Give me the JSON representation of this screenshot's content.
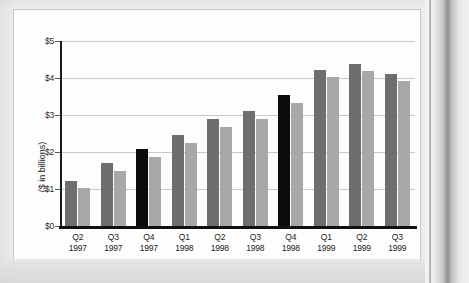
{
  "chart_data": {
    "type": "bar",
    "title": "",
    "subtitle": "",
    "xlabel": "",
    "ylabel": "($ in billions)",
    "ylim": [
      0,
      5
    ],
    "ytick_labels": [
      "$5",
      "$4",
      "$3",
      "$2",
      "$1",
      "$0"
    ],
    "ytick_values": [
      5,
      4,
      3,
      2,
      1,
      0
    ],
    "grid": true,
    "legend_position": "none",
    "categories": [
      "Q2\n1997",
      "Q3\n1997",
      "Q4\n1997",
      "Q1\n1998",
      "Q2\n1998",
      "Q3\n1998",
      "Q4\n1998",
      "Q1\n1999",
      "Q2\n1999",
      "Q3\n1999"
    ],
    "category_quarters": [
      "Q2",
      "Q3",
      "Q4",
      "Q1",
      "Q2",
      "Q3",
      "Q4",
      "Q1",
      "Q2",
      "Q3"
    ],
    "category_years": [
      "1997",
      "1997",
      "1997",
      "1998",
      "1998",
      "1998",
      "1998",
      "1999",
      "1999",
      "1999"
    ],
    "series": [
      {
        "name": "primary",
        "values": [
          1.22,
          1.7,
          2.07,
          2.45,
          2.89,
          3.1,
          3.53,
          4.22,
          4.38,
          4.11
        ],
        "color": "#6e6e6e",
        "highlight_color": "#0c0c0c",
        "highlighted_indices": [
          2,
          6
        ]
      },
      {
        "name": "secondary",
        "values": [
          1.04,
          1.49,
          1.86,
          2.25,
          2.68,
          2.9,
          3.33,
          4.02,
          4.18,
          3.91
        ],
        "color": "#a8a8a8"
      }
    ]
  },
  "colors": {
    "bar_dark": "#6e6e6e",
    "bar_black": "#0c0c0c",
    "bar_light": "#a8a8a8",
    "gridline": "#c9c9c7",
    "axis": "#111111",
    "card_background": "#fdfdfd",
    "page_background": "#ececeb"
  }
}
